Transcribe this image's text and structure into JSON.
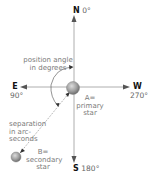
{
  "directions": {
    "north": {
      "letter": "N",
      "angle": "0°"
    },
    "east": {
      "letter": "E",
      "angle": "90°"
    },
    "west": {
      "letter": "W",
      "angle": "270°"
    },
    "south": {
      "letter": "S",
      "angle": "180°"
    }
  },
  "labels": {
    "position_angle_line1": "position angle",
    "position_angle_line2": "in degrees",
    "separation_line1": "separation",
    "separation_line2": "in arc-",
    "separation_line3": "seconds",
    "primary_line1": "A=",
    "primary_line2": "primary",
    "primary_line3": "star",
    "secondary_line1": "B=",
    "secondary_line2": "secondary",
    "secondary_line3": "star"
  },
  "colors": {
    "axis": "#8a8a8a",
    "arrow": "#555555",
    "star_fill": "#9a9a9a",
    "star_highlight": "#d0d0d0",
    "text": "#7a7a7a",
    "dotted": "#7a7a7a"
  }
}
